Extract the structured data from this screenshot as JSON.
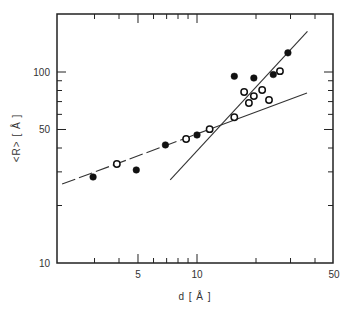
{
  "chart_data": {
    "type": "scatter",
    "title": "",
    "xlabel": "d [ Å ]",
    "ylabel": "<R> [ Å ]",
    "xscale": "log",
    "yscale": "log",
    "xlim": [
      1.93,
      50
    ],
    "ylim": [
      10,
      200
    ],
    "grid": false,
    "legend": "none",
    "x_ticks": [
      {
        "value": 5,
        "label": "5"
      },
      {
        "value": 10,
        "label": "10"
      },
      {
        "value": 50,
        "label": "50"
      }
    ],
    "x_minor_ticks": [
      3,
      4,
      6,
      7,
      8,
      9,
      20,
      30,
      40
    ],
    "y_ticks": [
      {
        "value": 10,
        "label": "10"
      },
      {
        "value": 50,
        "label": "50"
      },
      {
        "value": 100,
        "label": "100"
      }
    ],
    "y_minor_ticks": [
      20,
      30,
      40,
      60,
      70,
      80,
      90,
      200
    ],
    "series": [
      {
        "name": "filled circles",
        "marker": "filled-circle",
        "points": [
          {
            "x": 2.95,
            "y": 28.2
          },
          {
            "x": 4.9,
            "y": 30.7
          },
          {
            "x": 6.9,
            "y": 41.5
          },
          {
            "x": 10.0,
            "y": 46.8
          },
          {
            "x": 15.5,
            "y": 95
          },
          {
            "x": 19.5,
            "y": 93
          },
          {
            "x": 24.5,
            "y": 97
          },
          {
            "x": 29.1,
            "y": 126
          }
        ]
      },
      {
        "name": "open circles",
        "marker": "open-circle",
        "points": [
          {
            "x": 3.9,
            "y": 33.0
          },
          {
            "x": 8.8,
            "y": 44.6
          },
          {
            "x": 11.6,
            "y": 50.2
          },
          {
            "x": 15.5,
            "y": 58
          },
          {
            "x": 17.4,
            "y": 78.6
          },
          {
            "x": 18.4,
            "y": 68.8
          },
          {
            "x": 19.5,
            "y": 74.8
          },
          {
            "x": 21.5,
            "y": 80.5
          },
          {
            "x": 23.3,
            "y": 71.3
          },
          {
            "x": 26.5,
            "y": 101
          }
        ]
      }
    ],
    "lines": [
      {
        "name": "low-slope fit",
        "style": "dashed-then-solid",
        "from": {
          "x": 2.05,
          "y": 25.9
        },
        "to": {
          "x": 36.4,
          "y": 77.6
        },
        "dash_until_x": 11.6
      },
      {
        "name": "steep fit",
        "style": "solid",
        "from": {
          "x": 7.3,
          "y": 27.2
        },
        "to": {
          "x": 36.6,
          "y": 163
        }
      }
    ]
  }
}
